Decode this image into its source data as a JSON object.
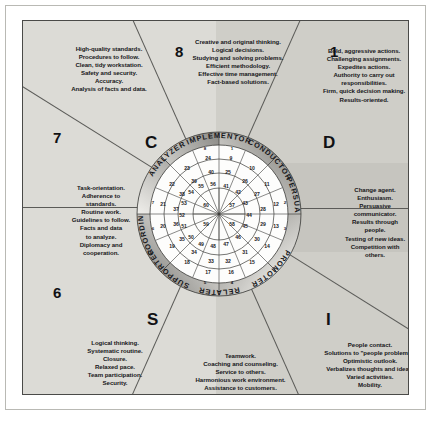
{
  "poster": {
    "title": "DISC Behavioral Styles Wheel",
    "background_colors": {
      "light_half": "#dcdbd6",
      "dark_half": "#cfcec8",
      "frame": "#4a4a48",
      "band_dark": "#8d8c88",
      "band_light": "#e9e8e4",
      "text": "#17171a"
    }
  },
  "disc_letters": [
    {
      "letter": "C",
      "position": "top-left"
    },
    {
      "letter": "D",
      "position": "top-right"
    },
    {
      "letter": "I",
      "position": "bottom-right"
    },
    {
      "letter": "S",
      "position": "bottom-left"
    }
  ],
  "segment_numbers": [
    "1",
    "2",
    "3",
    "4",
    "5",
    "6",
    "7",
    "8"
  ],
  "roles": [
    {
      "name": "IMPLEMENTOR",
      "position": "top"
    },
    {
      "name": "CONDUCTOR",
      "position": "top-right"
    },
    {
      "name": "PERSUADER",
      "position": "right"
    },
    {
      "name": "PROMOTER",
      "position": "bottom-right"
    },
    {
      "name": "RELATER",
      "position": "bottom"
    },
    {
      "name": "SUPPORTER",
      "position": "bottom-left"
    },
    {
      "name": "COORDINATOR",
      "position": "left"
    },
    {
      "name": "ANALYZER",
      "position": "top-left"
    }
  ],
  "blurbs": {
    "analyzer": [
      "High-quality standards.",
      "Procedures to follow.",
      "Clean, tidy workstation.",
      "Safety and security.",
      "Accuracy.",
      "Analysis of facts and data."
    ],
    "implementor": [
      "Creative and original thinking.",
      "Logical decisions.",
      "Studying and solving problems.",
      "Efficient methodology.",
      "Effective time management.",
      "Fact-based solutions."
    ],
    "conductor": [
      "Bold, aggressive actions.",
      "Challenging assignments.",
      "Expedites actions.",
      "Authority to carry out",
      "responsibilities.",
      "Firm, quick decision making.",
      "Results-oriented."
    ],
    "coordinator": [
      "Task-orientation.",
      "Adherence to",
      "standards.",
      "Routine work.",
      "Guidelines to follow.",
      "Facts and data",
      "to analyze.",
      "Diplomacy and",
      "cooperation."
    ],
    "persuader": [
      "Change agent.",
      "Enthusiasm.",
      "Persuasive",
      "communicator.",
      "Results through",
      "people.",
      "Testing of new ideas.",
      "Competition with",
      "others."
    ],
    "supporter": [
      "Logical thinking.",
      "Systematic routine.",
      "Closure.",
      "Relaxed pace.",
      "Team participation.",
      "Security."
    ],
    "relater": [
      "Teamwork.",
      "Coaching and counseling.",
      "Service to others.",
      "Harmonious work environment.",
      "Assistance to customers."
    ],
    "promoter": [
      "People contact.",
      "Solutions to \"people problems.\"",
      "Optimistic outlook.",
      "Verbalizes thoughts and ideas.",
      "Varied activities.",
      "Mobility."
    ]
  },
  "wheel": {
    "band_numbers": [
      "1",
      "2",
      "3",
      "4",
      "5",
      "6",
      "7",
      "8"
    ],
    "ring_outer": [
      "9",
      "10",
      "11",
      "12",
      "13",
      "14",
      "15",
      "16",
      "17",
      "18",
      "19",
      "20",
      "21",
      "22",
      "23",
      "24"
    ],
    "ring_second": [
      "25",
      "26",
      "27",
      "28",
      "29",
      "30",
      "31",
      "32",
      "33",
      "34",
      "35",
      "36",
      "37",
      "38",
      "39",
      "40"
    ],
    "ring_third": [
      "41",
      "42",
      "43",
      "44",
      "45",
      "46",
      "47",
      "48",
      "49",
      "50",
      "51",
      "52",
      "53",
      "54",
      "55",
      "56"
    ],
    "ring_inner": [
      "57",
      "58",
      "59",
      "60"
    ]
  }
}
